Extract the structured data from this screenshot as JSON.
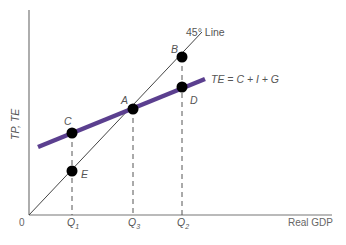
{
  "diagram": {
    "axes": {
      "y_label": "TP, TE",
      "x_label": "Real GDP",
      "origin_label": "0"
    },
    "lines": {
      "forty_five": {
        "label": "45° Line",
        "color": "#444444"
      },
      "te": {
        "label": "TE = C + I + G",
        "color": "#5b3f8f"
      }
    },
    "ticks": {
      "q1": {
        "base": "Q",
        "sub": "1"
      },
      "q3": {
        "base": "Q",
        "sub": "3"
      },
      "q2": {
        "base": "Q",
        "sub": "2"
      }
    },
    "points": {
      "a": "A",
      "b": "B",
      "c": "C",
      "d": "D",
      "e": "E"
    }
  }
}
